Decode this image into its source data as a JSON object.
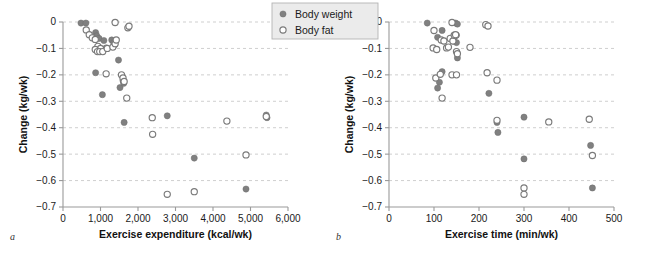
{
  "figure": {
    "legend": {
      "position": "top-center",
      "entries": [
        {
          "label": "Body weight",
          "marker": "filled-circle",
          "color": "#808080"
        },
        {
          "label": "Body fat",
          "marker": "open-circle",
          "color": "#ffffff"
        }
      ]
    }
  },
  "chart_data": [
    {
      "type": "scatter",
      "panel": "a",
      "panel_label": "a",
      "title": "",
      "xlabel": "Exercise expenditure (kcal/wk)",
      "ylabel": "Change (kg/wk)",
      "xlim": [
        0,
        6000
      ],
      "ylim": [
        -0.7,
        0
      ],
      "xticks": [
        0,
        1000,
        2000,
        3000,
        4000,
        5000,
        6000
      ],
      "xticklabels": [
        "0",
        "1,000",
        "2,000",
        "3,000",
        "4,000",
        "5,000",
        "6,000"
      ],
      "yticks": [
        0,
        -0.1,
        -0.2,
        -0.3,
        -0.4,
        -0.5,
        -0.6,
        -0.7
      ],
      "yticklabels": [
        "0",
        "-0.1",
        "-0.2",
        "-0.3",
        "-0.4",
        "-0.5",
        "-0.6",
        "-0.7"
      ],
      "grid": "horizontal-dashed",
      "series": [
        {
          "name": "Body weight",
          "marker": "filled-circle",
          "color": "#808080",
          "points": [
            [
              480,
              -0.004
            ],
            [
              610,
              -0.004
            ],
            [
              870,
              -0.04
            ],
            [
              900,
              -0.052
            ],
            [
              960,
              -0.062
            ],
            [
              1090,
              -0.07
            ],
            [
              1300,
              -0.068
            ],
            [
              1350,
              -0.078
            ],
            [
              1380,
              -0.086
            ],
            [
              1150,
              -0.098
            ],
            [
              1060,
              -0.108
            ],
            [
              870,
              -0.192
            ],
            [
              1480,
              -0.144
            ],
            [
              1520,
              -0.248
            ],
            [
              1620,
              -0.232
            ],
            [
              1600,
              -0.222
            ],
            [
              1050,
              -0.275
            ],
            [
              1630,
              -0.38
            ],
            [
              2780,
              -0.355
            ],
            [
              3500,
              -0.515
            ],
            [
              4880,
              -0.632
            ],
            [
              5420,
              -0.352
            ],
            [
              5440,
              -0.362
            ]
          ]
        },
        {
          "name": "Body fat",
          "marker": "open-circle",
          "color": "#ffffff",
          "points": [
            [
              620,
              -0.03
            ],
            [
              700,
              -0.048
            ],
            [
              780,
              -0.06
            ],
            [
              860,
              -0.066
            ],
            [
              930,
              -0.092
            ],
            [
              1000,
              -0.1
            ],
            [
              860,
              -0.104
            ],
            [
              920,
              -0.112
            ],
            [
              980,
              -0.112
            ],
            [
              1060,
              -0.112
            ],
            [
              1180,
              -0.1
            ],
            [
              1330,
              -0.095
            ],
            [
              1390,
              -0.082
            ],
            [
              1420,
              -0.068
            ],
            [
              1390,
              -0.002
            ],
            [
              1730,
              -0.022
            ],
            [
              1760,
              -0.016
            ],
            [
              1150,
              -0.196
            ],
            [
              1560,
              -0.2
            ],
            [
              1600,
              -0.212
            ],
            [
              1630,
              -0.225
            ],
            [
              1700,
              -0.288
            ],
            [
              2380,
              -0.362
            ],
            [
              2390,
              -0.425
            ],
            [
              2780,
              -0.652
            ],
            [
              3500,
              -0.642
            ],
            [
              4370,
              -0.375
            ],
            [
              4880,
              -0.503
            ],
            [
              5420,
              -0.358
            ]
          ]
        }
      ]
    },
    {
      "type": "scatter",
      "panel": "b",
      "panel_label": "b",
      "title": "",
      "xlabel": "Exercise time (min/wk)",
      "ylabel": "Change (kg/wk)",
      "xlim": [
        0,
        500
      ],
      "ylim": [
        -0.7,
        0
      ],
      "xticks": [
        0,
        100,
        200,
        300,
        400,
        500
      ],
      "xticklabels": [
        "0",
        "100",
        "200",
        "300",
        "400",
        "500"
      ],
      "yticks": [
        0,
        -0.1,
        -0.2,
        -0.3,
        -0.4,
        -0.5,
        -0.6,
        -0.7
      ],
      "yticklabels": [
        "0",
        "-0.1",
        "-0.2",
        "-0.3",
        "-0.4",
        "-0.5",
        "-0.6",
        "-0.7"
      ],
      "grid": "horizontal-dashed",
      "series": [
        {
          "name": "Body weight",
          "marker": "filled-circle",
          "color": "#808080",
          "points": [
            [
              85,
              -0.004
            ],
            [
              148,
              -0.004
            ],
            [
              152,
              -0.008
            ],
            [
              118,
              -0.032
            ],
            [
              108,
              -0.058
            ],
            [
              140,
              -0.06
            ],
            [
              146,
              -0.055
            ],
            [
              150,
              -0.05
            ],
            [
              143,
              -0.072
            ],
            [
              150,
              -0.078
            ],
            [
              152,
              -0.136
            ],
            [
              118,
              -0.188
            ],
            [
              112,
              -0.228
            ],
            [
              108,
              -0.25
            ],
            [
              222,
              -0.27
            ],
            [
              240,
              -0.38
            ],
            [
              242,
              -0.418
            ],
            [
              300,
              -0.36
            ],
            [
              300,
              -0.518
            ],
            [
              448,
              -0.467
            ],
            [
              452,
              -0.628
            ]
          ]
        },
        {
          "name": "Body fat",
          "marker": "open-circle",
          "color": "#ffffff",
          "points": [
            [
              100,
              -0.032
            ],
            [
              98,
              -0.098
            ],
            [
              106,
              -0.104
            ],
            [
              116,
              -0.068
            ],
            [
              122,
              -0.072
            ],
            [
              128,
              -0.098
            ],
            [
              132,
              -0.095
            ],
            [
              136,
              -0.062
            ],
            [
              140,
              -0.002
            ],
            [
              142,
              -0.072
            ],
            [
              145,
              -0.05
            ],
            [
              148,
              -0.048
            ],
            [
              150,
              -0.112
            ],
            [
              152,
              -0.12
            ],
            [
              180,
              -0.096
            ],
            [
              215,
              -0.01
            ],
            [
              220,
              -0.015
            ],
            [
              218,
              -0.192
            ],
            [
              240,
              -0.22
            ],
            [
              104,
              -0.212
            ],
            [
              114,
              -0.198
            ],
            [
              140,
              -0.2
            ],
            [
              150,
              -0.2
            ],
            [
              118,
              -0.288
            ],
            [
              240,
              -0.372
            ],
            [
              355,
              -0.378
            ],
            [
              445,
              -0.368
            ],
            [
              452,
              -0.505
            ],
            [
              300,
              -0.628
            ],
            [
              300,
              -0.652
            ]
          ]
        }
      ]
    }
  ]
}
